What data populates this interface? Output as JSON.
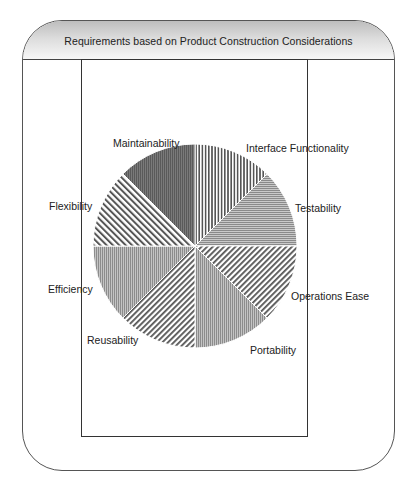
{
  "header": {
    "title": "Requirements based on Product Construction Considerations"
  },
  "chart_data": {
    "type": "pie",
    "title": "Requirements based on Product Construction Considerations",
    "categories": [
      "Interface Functionality",
      "Testability",
      "Operations Ease",
      "Portability",
      "Reusability",
      "Efficiency",
      "Flexibility",
      "Maintainability"
    ],
    "values": [
      12.5,
      12.5,
      12.5,
      12.5,
      12.5,
      12.5,
      12.5,
      12.5
    ],
    "start_angle": "12 o'clock",
    "direction": "clockwise",
    "legend": "none (direct labels around pie)",
    "patterns": [
      "vertical-stripes-wide",
      "horizontal-fine",
      "diagonal-forward",
      "vertical-fine-gray",
      "diagonal-forward",
      "vertical-fine-gray",
      "diagonal-back",
      "vertical-fine-dark"
    ]
  },
  "labels": {
    "interface_functionality": "Interface Functionality",
    "testability": "Testability",
    "operations_ease": "Operations Ease",
    "portability": "Portability",
    "reusability": "Reusability",
    "efficiency": "Efficiency",
    "flexibility": "Flexibility",
    "maintainability": "Maintainability"
  }
}
